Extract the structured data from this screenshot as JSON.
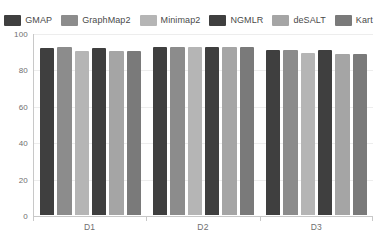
{
  "chart_data": {
    "type": "bar",
    "title": "",
    "subtitle": "",
    "xlabel": "",
    "ylabel": "",
    "categories": [
      "D1",
      "D2",
      "D3"
    ],
    "ylim": [
      0,
      100
    ],
    "yticks": [
      0,
      20,
      40,
      60,
      80,
      100
    ],
    "ytick_labels": [
      "0",
      "20",
      "40",
      "60",
      "80",
      "100"
    ],
    "grid": true,
    "legend_position": "top",
    "series": [
      {
        "name": "GMAP",
        "color": "#3f3f3f",
        "values": [
          91.5,
          92.5,
          90.5
        ]
      },
      {
        "name": "GraphMap2",
        "color": "#8c8c8c",
        "values": [
          92.5,
          92.5,
          90.5
        ]
      },
      {
        "name": "Minimap2",
        "color": "#b5b5b5",
        "values": [
          90.0,
          92.5,
          89.0
        ]
      },
      {
        "name": "NGMLR",
        "color": "#3f3f3f",
        "values": [
          91.5,
          92.5,
          90.5
        ]
      },
      {
        "name": "deSALT",
        "color": "#a5a5a5",
        "values": [
          90.0,
          92.5,
          88.5
        ]
      },
      {
        "name": "Kart",
        "color": "#7a7a7a",
        "values": [
          90.0,
          92.5,
          88.5
        ]
      }
    ]
  },
  "legend": {
    "items": [
      {
        "label": "GMAP"
      },
      {
        "label": "GraphMap2"
      },
      {
        "label": "Minimap2"
      },
      {
        "label": "NGMLR"
      },
      {
        "label": "deSALT"
      },
      {
        "label": "Kart"
      }
    ]
  },
  "axes": {
    "y_labels": [
      "100",
      "80",
      "60",
      "40",
      "20",
      "0"
    ],
    "x_labels": [
      "D1",
      "D2",
      "D3"
    ]
  },
  "colors": {
    "background": "#ffffff",
    "axis": "#c8c8c8",
    "gridline": "#ededed",
    "tick_text": "#6f6f6f",
    "legend_text": "#4a4a4a"
  }
}
